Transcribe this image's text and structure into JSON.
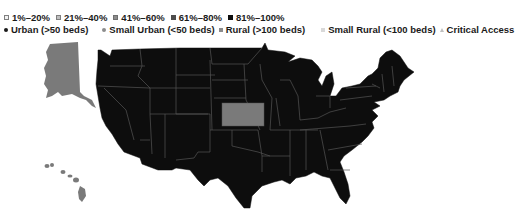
{
  "legend": {
    "percent_ranges": [
      {
        "label": "1%–20%",
        "color": "#f2f2f2",
        "border": "#7f7f7f"
      },
      {
        "label": "21%–40%",
        "color": "#bfbfbf",
        "border": "#7f7f7f"
      },
      {
        "label": "41%–60%",
        "color": "#8c8c8c",
        "border": "#6f6f6f"
      },
      {
        "label": "61%–80%",
        "color": "#4d4d4d",
        "border": "#4d4d4d"
      },
      {
        "label": "81%–100%",
        "color": "#0d0d0d",
        "border": "#0d0d0d"
      }
    ],
    "hospital_types": [
      {
        "label": "Urban (>50 beds)",
        "marker": "dot",
        "color": "#1a1a1a"
      },
      {
        "label": "Small Urban (<50 beds)",
        "marker": "dot",
        "color": "#8c8c8c"
      },
      {
        "label": "Rural (>100 beds)",
        "marker": "square",
        "color": "#8c8c8c"
      },
      {
        "label": "Small Rural (<100 beds)",
        "marker": "square",
        "color": "#d9d9d9"
      },
      {
        "label": "Critical Access",
        "marker": "triangle",
        "color": "#bfbfbf"
      }
    ]
  },
  "map": {
    "region": "United States",
    "states": {
      "default_category": "81%–100%",
      "default_color": "#0d0d0d",
      "highlighted": [
        {
          "name": "Kansas",
          "category": "41%–60%",
          "color": "#7a7a7a"
        },
        {
          "name": "Alaska",
          "category": "41%–60%",
          "color": "#7a7a7a"
        },
        {
          "name": "Hawaii",
          "category": "41%–60%",
          "color": "#7a7a7a"
        }
      ]
    },
    "border_color": "#555555"
  }
}
